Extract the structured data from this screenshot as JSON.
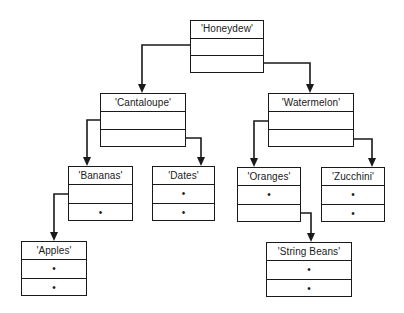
{
  "diagram": {
    "type": "binary-search-tree",
    "line_color": "#1a1a1a",
    "null_marker": "•",
    "nodes": [
      {
        "id": "honeydew",
        "label": "'Honeydew'",
        "left": "cantaloupe",
        "right": "watermelon",
        "left_text": "",
        "right_text": "",
        "box": [
          190,
          20,
          74,
          53
        ]
      },
      {
        "id": "cantaloupe",
        "label": "'Cantaloupe'",
        "left": "bananas",
        "right": "dates",
        "left_text": "",
        "right_text": "",
        "box": [
          100,
          93,
          86,
          54
        ]
      },
      {
        "id": "watermelon",
        "label": "'Watermelon'",
        "left": "oranges",
        "right": "zucchini",
        "left_text": "",
        "right_text": "",
        "box": [
          268,
          93,
          86,
          54
        ]
      },
      {
        "id": "bananas",
        "label": "'Bananas'",
        "left": "apples",
        "right": null,
        "left_text": "",
        "right_text": "•",
        "box": [
          68,
          166,
          65,
          55
        ]
      },
      {
        "id": "dates",
        "label": "'Dates'",
        "left": null,
        "right": null,
        "left_text": "•",
        "right_text": "•",
        "box": [
          152,
          166,
          63,
          55
        ]
      },
      {
        "id": "oranges",
        "label": "'Oranges'",
        "left": null,
        "right": "stringbeans",
        "left_text": "•",
        "right_text": "",
        "box": [
          237,
          167,
          64,
          55
        ]
      },
      {
        "id": "zucchini",
        "label": "'Zucchini'",
        "left": null,
        "right": null,
        "left_text": "•",
        "right_text": "•",
        "box": [
          321,
          167,
          64,
          55
        ]
      },
      {
        "id": "apples",
        "label": "'Apples'",
        "left": null,
        "right": null,
        "left_text": "•",
        "right_text": "•",
        "box": [
          21,
          241,
          66,
          55
        ]
      },
      {
        "id": "stringbeans",
        "label": "'String Beans'",
        "left": null,
        "right": null,
        "left_text": "•",
        "right_text": "•",
        "box": [
          266,
          242,
          86,
          55
        ]
      }
    ],
    "edges": [
      {
        "from": "honeydew",
        "to": "cantaloupe",
        "side": "left",
        "path": [
          [
            208,
            45
          ],
          [
            142,
            45
          ],
          [
            142,
            93
          ]
        ]
      },
      {
        "from": "honeydew",
        "to": "watermelon",
        "side": "right",
        "path": [
          [
            252,
            63
          ],
          [
            310,
            63
          ],
          [
            310,
            93
          ]
        ]
      },
      {
        "from": "cantaloupe",
        "to": "bananas",
        "side": "left",
        "path": [
          [
            113,
            120
          ],
          [
            87,
            120
          ],
          [
            87,
            166
          ]
        ]
      },
      {
        "from": "cantaloupe",
        "to": "dates",
        "side": "right",
        "path": [
          [
            174,
            138
          ],
          [
            201,
            138
          ],
          [
            201,
            166
          ]
        ]
      },
      {
        "from": "watermelon",
        "to": "oranges",
        "side": "left",
        "path": [
          [
            281,
            121
          ],
          [
            254,
            121
          ],
          [
            254,
            167
          ]
        ]
      },
      {
        "from": "watermelon",
        "to": "zucchini",
        "side": "right",
        "path": [
          [
            337,
            139
          ],
          [
            372,
            139
          ],
          [
            372,
            167
          ]
        ]
      },
      {
        "from": "bananas",
        "to": "apples",
        "side": "left",
        "path": [
          [
            81,
            194
          ],
          [
            54,
            194
          ],
          [
            54,
            241
          ]
        ]
      },
      {
        "from": "oranges",
        "to": "stringbeans",
        "side": "right",
        "path": [
          [
            288,
            213
          ],
          [
            311,
            213
          ],
          [
            311,
            242
          ]
        ]
      }
    ]
  }
}
